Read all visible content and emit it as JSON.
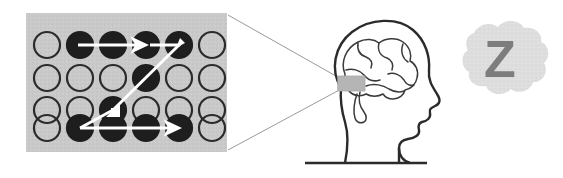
{
  "figure": {
    "background_color": "#ffffff"
  },
  "grid_panel": {
    "name": "neuron-grid-panel",
    "panel_color": "#c9c9c9",
    "x": 26,
    "y": 13,
    "width": 201,
    "height": 139,
    "columns": 6,
    "rows": 4,
    "circle_outline_color": "#2b2b2b",
    "circle_fill_active_color": "#1e1e1e",
    "circle_fill_inactive_color": "#c9c9c9",
    "circle_radius": 13,
    "cells": [
      {
        "row": 1,
        "col": 1,
        "state": "inactive"
      },
      {
        "row": 1,
        "col": 2,
        "state": "active"
      },
      {
        "row": 1,
        "col": 3,
        "state": "active"
      },
      {
        "row": 1,
        "col": 4,
        "state": "active"
      },
      {
        "row": 1,
        "col": 5,
        "state": "active"
      },
      {
        "row": 1,
        "col": 6,
        "state": "inactive"
      },
      {
        "row": 2,
        "col": 1,
        "state": "inactive"
      },
      {
        "row": 2,
        "col": 2,
        "state": "inactive"
      },
      {
        "row": 2,
        "col": 3,
        "state": "inactive"
      },
      {
        "row": 2,
        "col": 4,
        "state": "active"
      },
      {
        "row": 2,
        "col": 5,
        "state": "inactive"
      },
      {
        "row": 2,
        "col": 6,
        "state": "inactive"
      },
      {
        "row": 3,
        "col": 1,
        "state": "inactive"
      },
      {
        "row": 3,
        "col": 2,
        "state": "inactive"
      },
      {
        "row": 3,
        "col": 3,
        "state": "active"
      },
      {
        "row": 3,
        "col": 4,
        "state": "inactive"
      },
      {
        "row": 3,
        "col": 5,
        "state": "inactive"
      },
      {
        "row": 3,
        "col": 6,
        "state": "inactive"
      },
      {
        "row": 4,
        "col": 1,
        "state": "inactive"
      },
      {
        "row": 4,
        "col": 2,
        "state": "active"
      },
      {
        "row": 4,
        "col": 3,
        "state": "active"
      },
      {
        "row": 4,
        "col": 4,
        "state": "active"
      },
      {
        "row": 4,
        "col": 5,
        "state": "active"
      },
      {
        "row": 4,
        "col": 6,
        "state": "inactive"
      }
    ],
    "path": {
      "color": "#ffffff",
      "stroke_width": 3,
      "description": "Sequential activation path: row1 col2 to col5, diagonal down-left to row4 col2, then right to row4 col5",
      "segments": [
        {
          "from": {
            "row": 1,
            "col": 2
          },
          "to": {
            "row": 1,
            "col": 5
          },
          "arrowheads": [
            "mid",
            "end"
          ],
          "direction": "right"
        },
        {
          "from": {
            "row": 1,
            "col": 5
          },
          "to": {
            "row": 4,
            "col": 2
          },
          "arrowheads": [
            "mid"
          ],
          "direction": "down-left"
        },
        {
          "from": {
            "row": 4,
            "col": 2
          },
          "to": {
            "row": 4,
            "col": 5
          },
          "arrowheads": [
            "end"
          ],
          "direction": "right"
        }
      ]
    }
  },
  "callout": {
    "name": "callout-lines",
    "color": "#9a9a9a",
    "stroke_width": 1,
    "description": "Two thin lines from the grid panel corners converging on the highlighted hippocampus region"
  },
  "head": {
    "name": "head-profile",
    "facing": "right",
    "outline_color": "#2b2b2b",
    "fill_color": "#ffffff",
    "baseline": {
      "y": 163,
      "x1": 305,
      "x2": 427,
      "color": "#2b2b2b"
    }
  },
  "brain": {
    "name": "brain-illustration",
    "outline_color": "#3a3a3a",
    "highlight": {
      "name": "hippocampus-highlight",
      "color": "#b5b5b5",
      "x": 338,
      "y": 76,
      "width": 27,
      "height": 15
    }
  },
  "thought_bubble": {
    "name": "sleep-thought-bubble",
    "cloud_color": "#dedede",
    "letter": "Z",
    "letter_color": "#7d7d7d",
    "cx": 499,
    "cy": 63
  }
}
